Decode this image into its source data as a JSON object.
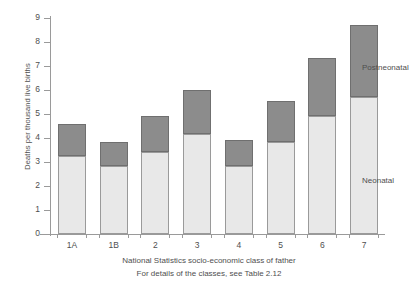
{
  "chart_data": {
    "type": "bar",
    "stacked": true,
    "title": "",
    "xlabel": "National Statistics socio-economic class of father",
    "ylabel": "Deaths per thousand live births",
    "ylim": [
      0,
      9
    ],
    "ytick_labels": [
      "0",
      "1",
      "2",
      "3",
      "4",
      "5",
      "6",
      "7",
      "8",
      "9"
    ],
    "yticks": [
      0,
      1,
      2,
      3,
      4,
      5,
      6,
      7,
      8,
      9
    ],
    "grid": false,
    "legend_position": "right-inline",
    "categories": [
      "1A",
      "1B",
      "2",
      "3",
      "4",
      "5",
      "6",
      "7"
    ],
    "series": [
      {
        "name": "Neonatal",
        "color": "#e8e8e8",
        "values": [
          3.25,
          2.85,
          3.4,
          4.15,
          2.85,
          3.85,
          4.9,
          5.7
        ]
      },
      {
        "name": "Postneonatal",
        "color": "#8c8c8c",
        "values": [
          1.35,
          1.0,
          1.5,
          1.85,
          1.05,
          1.7,
          2.45,
          3.0
        ]
      }
    ],
    "totals": [
      4.6,
      3.85,
      4.9,
      6.0,
      3.9,
      5.55,
      7.35,
      8.7
    ],
    "annotations": [
      "National Statistics socio-economic class of father",
      "For details of the classes, see Table 2.12"
    ]
  },
  "axis": {
    "y_title": "Deaths per thousand live births"
  },
  "legend": {
    "postneonatal": "Postneonatal",
    "neonatal": "Neonatal"
  },
  "caption": {
    "line1": "National Statistics socio-economic class of father",
    "line2": "For details of the classes, see Table 2.12"
  }
}
